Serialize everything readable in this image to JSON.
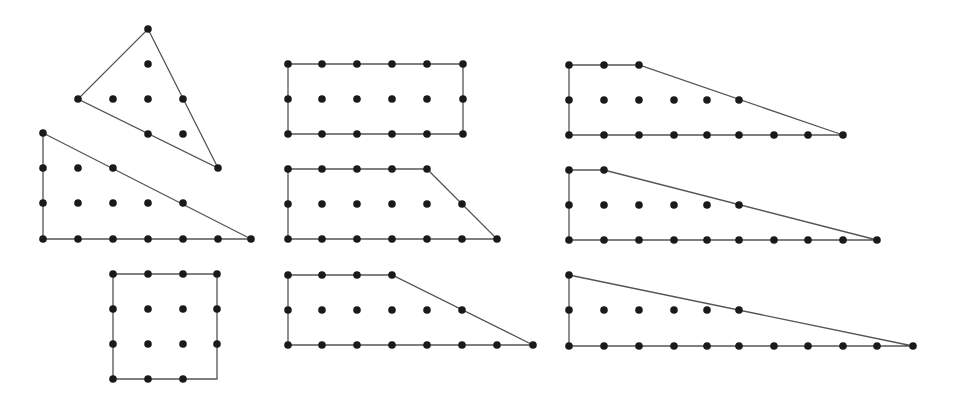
{
  "diagram": {
    "style": {
      "line_color": "#555555",
      "dot_color": "#1a1a1a",
      "background": "#ffffff",
      "dot_radius": 3.8
    },
    "shapes": [
      {
        "id": "tilted-triangle",
        "outline": [
          [
            148,
            29
          ],
          [
            218,
            168
          ],
          [
            78,
            99
          ]
        ],
        "points": [
          [
            148,
            29
          ],
          [
            148,
            64
          ],
          [
            78,
            99
          ],
          [
            113,
            99
          ],
          [
            148,
            99
          ],
          [
            183,
            99
          ],
          [
            148,
            134
          ],
          [
            183,
            134
          ],
          [
            218,
            168
          ]
        ]
      },
      {
        "id": "right-triangle-left",
        "outline": [
          [
            43,
            133
          ],
          [
            251,
            239
          ],
          [
            43,
            239
          ]
        ],
        "points": [
          [
            43,
            133
          ],
          [
            43,
            168
          ],
          [
            78,
            168
          ],
          [
            113,
            168
          ],
          [
            43,
            203
          ],
          [
            78,
            203
          ],
          [
            113,
            203
          ],
          [
            148,
            203
          ],
          [
            183,
            203
          ],
          [
            43,
            239
          ],
          [
            78,
            239
          ],
          [
            113,
            239
          ],
          [
            148,
            239
          ],
          [
            183,
            239
          ],
          [
            218,
            239
          ],
          [
            251,
            239
          ]
        ]
      },
      {
        "id": "square",
        "outline": [
          [
            113,
            274
          ],
          [
            217,
            274
          ],
          [
            217,
            379
          ],
          [
            113,
            379
          ]
        ],
        "points": [
          [
            113,
            274
          ],
          [
            148,
            274
          ],
          [
            183,
            274
          ],
          [
            217,
            274
          ],
          [
            113,
            309
          ],
          [
            148,
            309
          ],
          [
            183,
            309
          ],
          [
            217,
            309
          ],
          [
            113,
            344
          ],
          [
            148,
            344
          ],
          [
            183,
            344
          ],
          [
            217,
            344
          ],
          [
            113,
            379
          ],
          [
            148,
            379
          ],
          [
            183,
            379
          ]
        ]
      },
      {
        "id": "rectangle",
        "outline": [
          [
            288,
            64
          ],
          [
            463,
            64
          ],
          [
            463,
            134
          ],
          [
            288,
            134
          ]
        ],
        "points": [
          [
            288,
            64
          ],
          [
            322,
            64
          ],
          [
            357,
            64
          ],
          [
            392,
            64
          ],
          [
            427,
            64
          ],
          [
            463,
            64
          ],
          [
            288,
            99
          ],
          [
            322,
            99
          ],
          [
            357,
            99
          ],
          [
            392,
            99
          ],
          [
            427,
            99
          ],
          [
            463,
            99
          ],
          [
            288,
            134
          ],
          [
            322,
            134
          ],
          [
            357,
            134
          ],
          [
            392,
            134
          ],
          [
            427,
            134
          ],
          [
            463,
            134
          ]
        ]
      },
      {
        "id": "trapezoid-middle-1",
        "outline": [
          [
            288,
            169
          ],
          [
            427,
            169
          ],
          [
            497,
            239
          ],
          [
            288,
            239
          ]
        ],
        "points": [
          [
            288,
            169
          ],
          [
            322,
            169
          ],
          [
            357,
            169
          ],
          [
            392,
            169
          ],
          [
            427,
            169
          ],
          [
            288,
            204
          ],
          [
            322,
            204
          ],
          [
            357,
            204
          ],
          [
            392,
            204
          ],
          [
            427,
            204
          ],
          [
            462,
            204
          ],
          [
            288,
            239
          ],
          [
            322,
            239
          ],
          [
            357,
            239
          ],
          [
            392,
            239
          ],
          [
            427,
            239
          ],
          [
            462,
            239
          ],
          [
            497,
            239
          ]
        ]
      },
      {
        "id": "trapezoid-middle-2",
        "outline": [
          [
            288,
            275
          ],
          [
            392,
            275
          ],
          [
            533,
            345
          ],
          [
            288,
            345
          ]
        ],
        "points": [
          [
            288,
            275
          ],
          [
            322,
            275
          ],
          [
            357,
            275
          ],
          [
            392,
            275
          ],
          [
            288,
            310
          ],
          [
            322,
            310
          ],
          [
            357,
            310
          ],
          [
            392,
            310
          ],
          [
            427,
            310
          ],
          [
            462,
            310
          ],
          [
            288,
            345
          ],
          [
            322,
            345
          ],
          [
            357,
            345
          ],
          [
            392,
            345
          ],
          [
            427,
            345
          ],
          [
            462,
            345
          ],
          [
            497,
            345
          ],
          [
            533,
            345
          ]
        ]
      },
      {
        "id": "trapezoid-right-1",
        "outline": [
          [
            569,
            65
          ],
          [
            639,
            65
          ],
          [
            843,
            135
          ],
          [
            569,
            135
          ]
        ],
        "points": [
          [
            569,
            65
          ],
          [
            604,
            65
          ],
          [
            639,
            65
          ],
          [
            569,
            100
          ],
          [
            604,
            100
          ],
          [
            639,
            100
          ],
          [
            674,
            100
          ],
          [
            707,
            100
          ],
          [
            739,
            100
          ],
          [
            569,
            135
          ],
          [
            604,
            135
          ],
          [
            639,
            135
          ],
          [
            674,
            135
          ],
          [
            707,
            135
          ],
          [
            739,
            135
          ],
          [
            774,
            135
          ],
          [
            808,
            135
          ],
          [
            843,
            135
          ]
        ]
      },
      {
        "id": "trapezoid-right-2",
        "outline": [
          [
            569,
            170
          ],
          [
            604,
            170
          ],
          [
            877,
            240
          ],
          [
            569,
            240
          ]
        ],
        "points": [
          [
            569,
            170
          ],
          [
            604,
            170
          ],
          [
            569,
            205
          ],
          [
            604,
            205
          ],
          [
            639,
            205
          ],
          [
            674,
            205
          ],
          [
            707,
            205
          ],
          [
            739,
            205
          ],
          [
            569,
            240
          ],
          [
            604,
            240
          ],
          [
            639,
            240
          ],
          [
            674,
            240
          ],
          [
            707,
            240
          ],
          [
            739,
            240
          ],
          [
            774,
            240
          ],
          [
            808,
            240
          ],
          [
            843,
            240
          ],
          [
            877,
            240
          ]
        ]
      },
      {
        "id": "right-triangle-right",
        "outline": [
          [
            569,
            275
          ],
          [
            913,
            346
          ],
          [
            569,
            346
          ]
        ],
        "points": [
          [
            569,
            275
          ],
          [
            569,
            310
          ],
          [
            604,
            310
          ],
          [
            639,
            310
          ],
          [
            674,
            310
          ],
          [
            707,
            310
          ],
          [
            739,
            310
          ],
          [
            569,
            346
          ],
          [
            604,
            346
          ],
          [
            639,
            346
          ],
          [
            674,
            346
          ],
          [
            707,
            346
          ],
          [
            739,
            346
          ],
          [
            774,
            346
          ],
          [
            808,
            346
          ],
          [
            843,
            346
          ],
          [
            877,
            346
          ],
          [
            913,
            346
          ]
        ]
      }
    ]
  }
}
